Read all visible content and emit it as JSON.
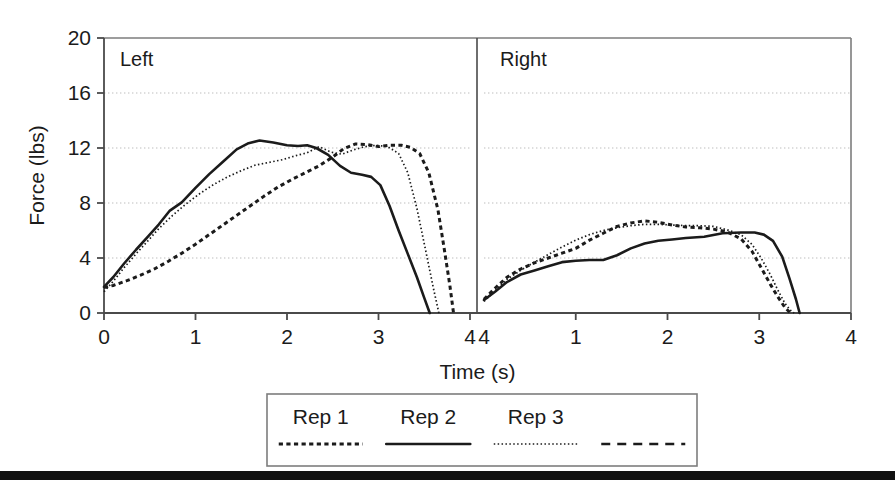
{
  "chart_data": {
    "type": "line",
    "title": "",
    "xlabel": "Time (s)",
    "ylabel": "Force (lbs)",
    "ylim": [
      0,
      20
    ],
    "yticks": [
      0,
      4,
      8,
      12,
      16,
      20
    ],
    "ytick_labels": [
      "0",
      "4",
      "8",
      "12",
      "16",
      "20"
    ],
    "grid": "horizontal-dotted",
    "legend_position": "bottom",
    "panels": [
      {
        "name": "left",
        "label": "Left",
        "xlim": [
          0,
          4
        ],
        "xticks": [
          0,
          1,
          2,
          3,
          4
        ],
        "xtick_labels": [
          "0",
          "1",
          "2",
          "3",
          "4"
        ],
        "series": [
          {
            "name": "Rep 1",
            "style": "dotted",
            "x": [
              0.0,
              0.1,
              0.25,
              0.4,
              0.55,
              0.7,
              0.85,
              1.0,
              1.15,
              1.3,
              1.45,
              1.6,
              1.75,
              1.9,
              2.05,
              2.2,
              2.35,
              2.5,
              2.62,
              2.75,
              2.88,
              3.0,
              3.12,
              3.25,
              3.35,
              3.45,
              3.55,
              3.65,
              3.72,
              3.78,
              3.82
            ],
            "y": [
              1.85,
              2.0,
              2.35,
              2.75,
              3.2,
              3.75,
              4.35,
              5.0,
              5.7,
              6.4,
              7.1,
              7.8,
              8.5,
              9.15,
              9.7,
              10.2,
              10.7,
              11.35,
              11.95,
              12.3,
              12.25,
              12.1,
              12.2,
              12.2,
              12.05,
              11.6,
              10.2,
              7.5,
              4.6,
              2.0,
              0.0
            ]
          },
          {
            "name": "Rep 2",
            "style": "solid",
            "x": [
              0.0,
              0.1,
              0.22,
              0.35,
              0.48,
              0.6,
              0.72,
              0.85,
              1.0,
              1.15,
              1.3,
              1.45,
              1.58,
              1.7,
              1.85,
              2.0,
              2.12,
              2.22,
              2.32,
              2.45,
              2.58,
              2.7,
              2.82,
              2.92,
              3.02,
              3.12,
              3.22,
              3.32,
              3.42,
              3.5,
              3.56
            ],
            "y": [
              1.9,
              2.6,
              3.6,
              4.6,
              5.55,
              6.45,
              7.45,
              8.05,
              9.1,
              10.1,
              11.0,
              11.9,
              12.35,
              12.55,
              12.4,
              12.2,
              12.15,
              12.2,
              12.0,
              11.5,
              10.7,
              10.2,
              10.05,
              9.9,
              9.3,
              7.8,
              6.0,
              4.3,
              2.6,
              1.1,
              0.0
            ]
          },
          {
            "name": "Rep 3",
            "style": "fine-dotted",
            "x": [
              0.0,
              0.1,
              0.22,
              0.35,
              0.48,
              0.6,
              0.75,
              0.9,
              1.05,
              1.2,
              1.35,
              1.5,
              1.65,
              1.8,
              1.95,
              2.1,
              2.22,
              2.35,
              2.48,
              2.6,
              2.72,
              2.85,
              2.98,
              3.1,
              3.22,
              3.32,
              3.42,
              3.52,
              3.6,
              3.66
            ],
            "y": [
              1.55,
              2.3,
              3.3,
              4.3,
              5.25,
              6.15,
              7.1,
              7.95,
              8.7,
              9.35,
              9.9,
              10.35,
              10.75,
              10.95,
              11.15,
              11.45,
              11.65,
              12.1,
              11.7,
              11.55,
              11.85,
              12.1,
              12.2,
              12.1,
              11.6,
              10.2,
              7.6,
              4.4,
              1.8,
              0.0
            ]
          }
        ]
      },
      {
        "name": "right",
        "label": "Right",
        "xlim": [
          0,
          4
        ],
        "xticks": [
          0,
          1,
          2,
          3,
          4
        ],
        "xtick_labels": [
          "4",
          "1",
          "2",
          "3",
          "4"
        ],
        "series": [
          {
            "name": "Rep 1",
            "style": "dotted",
            "x": [
              0.0,
              0.12,
              0.25,
              0.4,
              0.55,
              0.7,
              0.85,
              1.0,
              1.15,
              1.3,
              1.45,
              1.6,
              1.75,
              1.9,
              2.05,
              2.2,
              2.35,
              2.5,
              2.65,
              2.8,
              2.92,
              3.02,
              3.12,
              3.2,
              3.28,
              3.34
            ],
            "y": [
              1.0,
              1.8,
              2.6,
              3.2,
              3.65,
              4.0,
              4.35,
              4.7,
              5.3,
              5.8,
              6.3,
              6.55,
              6.7,
              6.6,
              6.4,
              6.25,
              6.2,
              6.1,
              5.9,
              5.4,
              4.5,
              3.3,
              2.1,
              1.2,
              0.4,
              0.0
            ]
          },
          {
            "name": "Rep 2",
            "style": "solid",
            "x": [
              0.0,
              0.12,
              0.25,
              0.4,
              0.55,
              0.7,
              0.85,
              1.0,
              1.15,
              1.3,
              1.45,
              1.6,
              1.75,
              1.9,
              2.05,
              2.2,
              2.4,
              2.6,
              2.8,
              2.95,
              3.05,
              3.15,
              3.25,
              3.33,
              3.4,
              3.44
            ],
            "y": [
              0.95,
              1.55,
              2.25,
              2.8,
              3.1,
              3.4,
              3.7,
              3.8,
              3.85,
              3.85,
              4.2,
              4.7,
              5.05,
              5.25,
              5.35,
              5.45,
              5.55,
              5.8,
              5.85,
              5.85,
              5.7,
              5.25,
              4.1,
              2.5,
              1.0,
              0.0
            ]
          },
          {
            "name": "Rep 3",
            "style": "fine-dotted",
            "x": [
              0.0,
              0.12,
              0.25,
              0.4,
              0.55,
              0.7,
              0.85,
              1.0,
              1.15,
              1.3,
              1.45,
              1.6,
              1.75,
              1.9,
              2.05,
              2.2,
              2.35,
              2.5,
              2.65,
              2.8,
              2.92,
              3.02,
              3.12,
              3.2,
              3.28,
              3.34,
              3.38
            ],
            "y": [
              0.85,
              1.6,
              2.45,
              3.1,
              3.7,
              4.25,
              4.8,
              5.3,
              5.7,
              6.0,
              6.2,
              6.35,
              6.45,
              6.45,
              6.4,
              6.35,
              6.35,
              6.3,
              6.05,
              5.7,
              5.0,
              4.0,
              2.8,
              1.7,
              0.7,
              0.2,
              0.0
            ]
          }
        ]
      }
    ],
    "legend": {
      "entries": [
        {
          "label": "Rep 1",
          "style": "dotted"
        },
        {
          "label": "Rep 2",
          "style": "solid"
        },
        {
          "label": "Rep 3",
          "style": "fine-dotted"
        },
        {
          "label": "",
          "style": "dashed"
        }
      ]
    }
  },
  "colors": {
    "line": "#1b1b1b",
    "grid": "#bdbdbd",
    "axis": "#4a4a4a",
    "frame": "#7d7d7d",
    "background": "#ffffff",
    "scan_bar": "#111111"
  },
  "geometry": {
    "plot_left": 104,
    "plot_right": 851,
    "plot_top": 38,
    "plot_bottom": 313,
    "panel_divider": 477,
    "panel_gap": 14,
    "legend_box": {
      "x": 267,
      "y": 394,
      "w": 430,
      "h": 72
    }
  }
}
